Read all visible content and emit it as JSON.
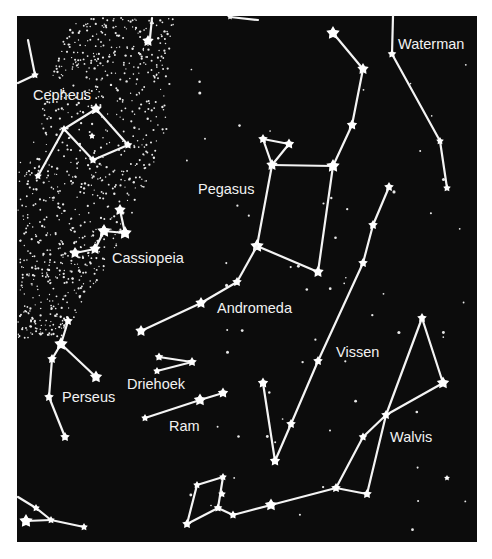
{
  "map": {
    "background": "#0c0c0c",
    "foreground": "#ffffff",
    "panel": {
      "x": 17,
      "y": 16,
      "w": 460,
      "h": 526
    }
  },
  "constellations": [
    {
      "name": "Cepheus",
      "label": {
        "text": "Cepheus",
        "x": 33,
        "y": 100
      },
      "stars": [
        [
          35,
          75,
          3
        ],
        [
          96,
          109,
          5
        ],
        [
          64,
          129,
          3
        ],
        [
          128,
          145,
          3.5
        ],
        [
          93,
          160,
          3.5
        ],
        [
          38,
          176,
          3
        ],
        [
          92,
          136,
          2.5
        ]
      ],
      "lines": [
        [
          [
            28,
            40
          ],
          [
            35,
            75
          ]
        ],
        [
          [
            18,
            83
          ],
          [
            35,
            75
          ]
        ],
        [
          [
            96,
            109
          ],
          [
            64,
            129
          ]
        ],
        [
          [
            96,
            109
          ],
          [
            128,
            145
          ]
        ],
        [
          [
            64,
            129
          ],
          [
            93,
            160
          ]
        ],
        [
          [
            128,
            145
          ],
          [
            93,
            160
          ]
        ],
        [
          [
            64,
            129
          ],
          [
            38,
            176
          ]
        ]
      ]
    },
    {
      "name": "Cassiopeia",
      "label": {
        "text": "Cassiopeia",
        "x": 112,
        "y": 263
      },
      "stars": [
        [
          120,
          210,
          5
        ],
        [
          104,
          231,
          6
        ],
        [
          125,
          233,
          6
        ],
        [
          95,
          249,
          5
        ],
        [
          75,
          253,
          5
        ]
      ],
      "lines": [
        [
          [
            120,
            210
          ],
          [
            125,
            233
          ]
        ],
        [
          [
            104,
            231
          ],
          [
            125,
            233
          ]
        ],
        [
          [
            104,
            231
          ],
          [
            95,
            249
          ]
        ],
        [
          [
            95,
            249
          ],
          [
            75,
            253
          ]
        ]
      ]
    },
    {
      "name": "Pegasus",
      "label": {
        "text": "Pegasus",
        "x": 198,
        "y": 194
      },
      "stars": [
        [
          333,
          33,
          6
        ],
        [
          363,
          69,
          5
        ],
        [
          352,
          125,
          4.5
        ],
        [
          263,
          139,
          4
        ],
        [
          289,
          144,
          4.5
        ],
        [
          272,
          165,
          5
        ],
        [
          333,
          166,
          6
        ],
        [
          257,
          246,
          6
        ],
        [
          318,
          272,
          5
        ]
      ],
      "lines": [
        [
          [
            333,
            33
          ],
          [
            363,
            69
          ]
        ],
        [
          [
            363,
            69
          ],
          [
            352,
            125
          ]
        ],
        [
          [
            352,
            125
          ],
          [
            333,
            166
          ]
        ],
        [
          [
            272,
            165
          ],
          [
            333,
            166
          ]
        ],
        [
          [
            263,
            139
          ],
          [
            272,
            165
          ]
        ],
        [
          [
            289,
            144
          ],
          [
            272,
            165
          ]
        ],
        [
          [
            263,
            139
          ],
          [
            289,
            144
          ]
        ],
        [
          [
            272,
            165
          ],
          [
            257,
            246
          ]
        ],
        [
          [
            333,
            166
          ],
          [
            318,
            272
          ]
        ],
        [
          [
            257,
            246
          ],
          [
            318,
            272
          ]
        ]
      ]
    },
    {
      "name": "Waterman",
      "label": {
        "text": "Waterman",
        "x": 398,
        "y": 49
      },
      "stars": [
        [
          392,
          54,
          3.5
        ],
        [
          440,
          141,
          3
        ],
        [
          447,
          188,
          3
        ]
      ],
      "lines": [
        [
          [
            393,
            16
          ],
          [
            392,
            54
          ]
        ],
        [
          [
            392,
            54
          ],
          [
            440,
            141
          ]
        ],
        [
          [
            440,
            141
          ],
          [
            447,
            188
          ]
        ]
      ]
    },
    {
      "name": "Andromeda",
      "label": {
        "text": "Andromeda",
        "x": 217,
        "y": 313
      },
      "stars": [
        [
          237,
          282,
          4
        ],
        [
          201,
          303,
          5
        ],
        [
          141,
          331,
          5
        ]
      ],
      "lines": [
        [
          [
            257,
            246
          ],
          [
            237,
            282
          ]
        ],
        [
          [
            237,
            282
          ],
          [
            201,
            303
          ]
        ],
        [
          [
            201,
            303
          ],
          [
            141,
            331
          ]
        ]
      ]
    },
    {
      "name": "Vissen",
      "label": {
        "text": "Vissen",
        "x": 336,
        "y": 357
      },
      "stars": [
        [
          389,
          187,
          4
        ],
        [
          373,
          225,
          4
        ],
        [
          363,
          263,
          4
        ],
        [
          318,
          361,
          4
        ],
        [
          263,
          383,
          4.5
        ],
        [
          291,
          424,
          4
        ],
        [
          275,
          461,
          4.5
        ]
      ],
      "lines": [
        [
          [
            389,
            187
          ],
          [
            373,
            225
          ]
        ],
        [
          [
            373,
            225
          ],
          [
            363,
            263
          ]
        ],
        [
          [
            363,
            263
          ],
          [
            318,
            361
          ]
        ],
        [
          [
            318,
            361
          ],
          [
            291,
            424
          ]
        ],
        [
          [
            291,
            424
          ],
          [
            275,
            461
          ]
        ],
        [
          [
            263,
            383
          ],
          [
            275,
            461
          ]
        ]
      ]
    },
    {
      "name": "Perseus",
      "label": {
        "text": "Perseus",
        "x": 62,
        "y": 402
      },
      "stars": [
        [
          68,
          321,
          4
        ],
        [
          61,
          344,
          6
        ],
        [
          52,
          359,
          4
        ],
        [
          96,
          377,
          5.5
        ],
        [
          49,
          397,
          4
        ],
        [
          65,
          437,
          4
        ]
      ],
      "lines": [
        [
          [
            68,
            321
          ],
          [
            61,
            344
          ]
        ],
        [
          [
            61,
            344
          ],
          [
            52,
            359
          ]
        ],
        [
          [
            61,
            344
          ],
          [
            96,
            377
          ]
        ],
        [
          [
            52,
            359
          ],
          [
            49,
            397
          ]
        ],
        [
          [
            49,
            397
          ],
          [
            65,
            437
          ]
        ]
      ]
    },
    {
      "name": "Driehoek",
      "label": {
        "text": "Driehoek",
        "x": 127,
        "y": 389
      },
      "stars": [
        [
          159,
          357,
          3.5
        ],
        [
          192,
          362,
          4
        ],
        [
          157,
          371,
          3
        ]
      ],
      "lines": [
        [
          [
            159,
            357
          ],
          [
            192,
            362
          ]
        ],
        [
          [
            157,
            371
          ],
          [
            192,
            362
          ]
        ]
      ]
    },
    {
      "name": "Ram",
      "label": {
        "text": "Ram",
        "x": 169,
        "y": 431
      },
      "stars": [
        [
          223,
          393,
          4.5
        ],
        [
          200,
          400,
          5.5
        ],
        [
          145,
          418,
          3
        ]
      ],
      "lines": [
        [
          [
            223,
            393
          ],
          [
            200,
            400
          ]
        ],
        [
          [
            200,
            400
          ],
          [
            145,
            418
          ]
        ]
      ]
    },
    {
      "name": "Walvis",
      "label": {
        "text": "Walvis",
        "x": 390,
        "y": 442
      },
      "stars": [
        [
          422,
          318,
          4
        ],
        [
          443,
          383,
          5.5
        ],
        [
          386,
          415,
          4
        ],
        [
          363,
          437,
          3.5
        ],
        [
          336,
          488,
          4
        ],
        [
          367,
          494,
          4
        ],
        [
          271,
          505,
          5.5
        ]
      ],
      "lines": [
        [
          [
            422,
            318
          ],
          [
            443,
            383
          ]
        ],
        [
          [
            422,
            318
          ],
          [
            386,
            415
          ]
        ],
        [
          [
            443,
            383
          ],
          [
            386,
            415
          ]
        ],
        [
          [
            386,
            415
          ],
          [
            363,
            437
          ]
        ],
        [
          [
            363,
            437
          ],
          [
            336,
            488
          ]
        ],
        [
          [
            386,
            415
          ],
          [
            367,
            494
          ]
        ],
        [
          [
            336,
            488
          ],
          [
            367,
            494
          ]
        ],
        [
          [
            336,
            488
          ],
          [
            271,
            505
          ]
        ],
        [
          [
            271,
            505
          ],
          [
            233,
            515
          ]
        ]
      ]
    },
    {
      "name": "Vissen-south",
      "label": null,
      "stars": [
        [
          197,
          485,
          3
        ],
        [
          223,
          477,
          3
        ],
        [
          222,
          494,
          3
        ],
        [
          218,
          508,
          3.5
        ],
        [
          233,
          515,
          3.5
        ],
        [
          187,
          524,
          4
        ]
      ],
      "lines": [
        [
          [
            197,
            485
          ],
          [
            223,
            477
          ]
        ],
        [
          [
            223,
            477
          ],
          [
            218,
            508
          ]
        ],
        [
          [
            197,
            485
          ],
          [
            187,
            524
          ]
        ],
        [
          [
            187,
            524
          ],
          [
            218,
            508
          ]
        ],
        [
          [
            218,
            508
          ],
          [
            233,
            515
          ]
        ]
      ]
    },
    {
      "name": "Perseus-south",
      "label": null,
      "stars": [
        [
          36,
          508,
          3
        ],
        [
          26,
          521,
          6
        ],
        [
          51,
          520,
          3
        ],
        [
          84,
          527,
          3
        ]
      ],
      "lines": [
        [
          [
            18,
            497
          ],
          [
            36,
            508
          ]
        ],
        [
          [
            36,
            508
          ],
          [
            51,
            520
          ]
        ],
        [
          [
            26,
            521
          ],
          [
            51,
            520
          ]
        ],
        [
          [
            51,
            520
          ],
          [
            84,
            527
          ]
        ]
      ]
    }
  ],
  "topStars": [
    [
      148,
      41,
      6
    ],
    [
      230,
      17,
      3
    ]
  ]
}
